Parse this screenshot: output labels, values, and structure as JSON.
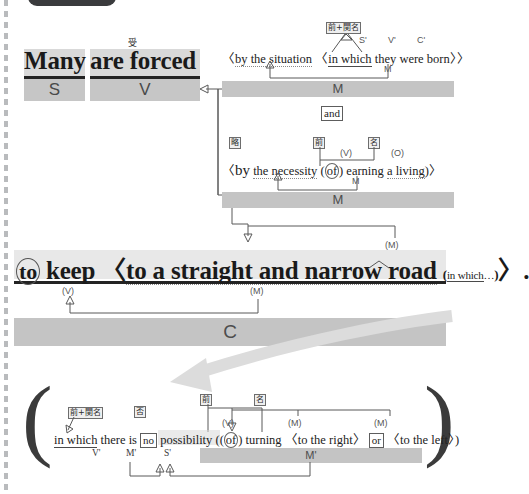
{
  "page": {
    "language_labels": {
      "passive": "受",
      "prep_plus_rel": "前+関名",
      "ellipsis": "略",
      "preposition": "前",
      "noun": "名",
      "negation": "否"
    }
  },
  "clause1": {
    "subject_text": "Many",
    "verb_text": "are forced",
    "passive_tag": "受",
    "subject_role": "S",
    "verb_role": "V"
  },
  "modifier1": {
    "tag": "前+関名",
    "roles": [
      "S'",
      "V'",
      "C'"
    ],
    "open_angle": "〈",
    "text_a": "by the situation",
    "inner_open": "〈",
    "rel": "in which",
    "text_b": "they were born",
    "inner_close": "〉",
    "close_angle": "〉",
    "inner_role": "M",
    "bar_label": "M"
  },
  "connector": {
    "label": "and"
  },
  "modifier2": {
    "tag": "略",
    "open_angle": "〈",
    "lead": "by",
    "text_a": "the necessity",
    "inner_open": "(",
    "prep": "of",
    "prep_tag": "前",
    "noun_tag": "名",
    "verb_role": "(V)",
    "object_role": "(O)",
    "gerund": "earning",
    "object": "a living",
    "inner_close": ")",
    "close_angle": "〉",
    "inner_role": "M",
    "bar_label": "M"
  },
  "clause2": {
    "to": "to",
    "keep": "keep",
    "open_angle": "〈",
    "prep_phrase": "to a straight and narrow road",
    "inner_open": "(",
    "rel": "in which",
    "ellipsis_dots": "…",
    "inner_close": ")",
    "close_angle": "〉",
    "period": ".",
    "verb_role": "(V)",
    "mod_role": "(M)",
    "top_mod_role": "(M)",
    "bar_label": "C"
  },
  "expansion": {
    "open_paren": "(",
    "close_paren": ")",
    "rel_tag": "前+関名",
    "neg_tag": "否",
    "prep_tag": "前",
    "noun_tag": "名",
    "rel": "in which",
    "there_is": "there is",
    "no": "no",
    "possibility": "possibility",
    "inner_open": "(",
    "of": "of",
    "turning": "turning",
    "open_angle1": "〈",
    "to_the_right": "to the right",
    "close_angle1": "〉",
    "or": "or",
    "open_angle2": "〈",
    "to_the_left": "to the left",
    "close_angle2": "〉",
    "inner_close": ")",
    "roles": {
      "v": "V'",
      "m_neg": "M'",
      "s": "S'",
      "m_phrase": "M'",
      "verb_paren": "(V)",
      "mod1": "(M)",
      "mod2": "(M)"
    }
  },
  "colors": {
    "highlight": "#d9d9d9",
    "band": "#c6c6c6",
    "bar": "#c4c4c4",
    "arrow_gray": "#d8d8d8",
    "line": "#585858",
    "text": "#1a1a1a"
  }
}
